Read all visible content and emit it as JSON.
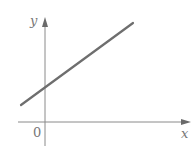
{
  "diagram": {
    "type": "linear-function-graph",
    "axes": {
      "x_label": "x",
      "y_label": "y",
      "origin_label": "0"
    },
    "line": {
      "description": "straight line with positive slope and positive y-intercept",
      "color": "#6e6e6e"
    },
    "colors": {
      "axis": "#8a8a8a",
      "line": "#6e6e6e",
      "text": "#777777",
      "background": "#ffffff"
    }
  }
}
